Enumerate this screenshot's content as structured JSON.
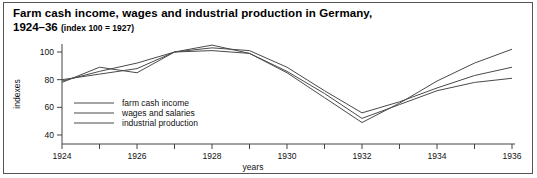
{
  "figure": {
    "title_line1": "Farm cash income, wages and industrial production in Germany,",
    "title_line2_years": "1924–36",
    "title_line2_sub": "(index 100 = 1927)"
  },
  "chart_data": {
    "type": "line",
    "title": "Farm cash income, wages and industrial production in Germany, 1924–36 (index 100 = 1927)",
    "subtitle": "(index 100 = 1927)",
    "xlabel": "years",
    "ylabel": "indexes",
    "xlim": [
      1924,
      1936
    ],
    "ylim": [
      40,
      108
    ],
    "grid": false,
    "legend_position": "inside-bottom-left",
    "yticks": [
      40,
      60,
      80,
      100
    ],
    "ytick_labels": [
      "40",
      "60",
      "80",
      "100"
    ],
    "xticks": [
      1924,
      1925,
      1926,
      1927,
      1928,
      1929,
      1930,
      1931,
      1932,
      1933,
      1934,
      1935,
      1936
    ],
    "xtick_labels": [
      "1924",
      "",
      "1926",
      "",
      "1928",
      "",
      "1930",
      "",
      "1932",
      "",
      "1934",
      "",
      "1936"
    ],
    "x": [
      1924,
      1925,
      1926,
      1927,
      1928,
      1929,
      1930,
      1931,
      1932,
      1933,
      1934,
      1935,
      1936
    ],
    "series": [
      {
        "name": "farm cash income",
        "color": "#4a4a4a",
        "values": [
          79,
          86,
          92,
          100,
          105,
          99,
          86,
          70,
          52,
          62,
          72,
          78,
          81
        ]
      },
      {
        "name": "wages and salaries",
        "color": "#4a4a4a",
        "values": [
          80,
          84,
          88,
          100,
          103,
          101,
          89,
          72,
          56,
          64,
          74,
          83,
          89
        ]
      },
      {
        "name": "industrial production",
        "color": "#4a4a4a",
        "values": [
          78,
          89,
          85,
          100,
          101,
          99,
          85,
          67,
          49,
          63,
          79,
          92,
          102
        ]
      }
    ]
  },
  "legend": {
    "items": [
      {
        "label": "farm cash income"
      },
      {
        "label": "wages and salaries"
      },
      {
        "label": "industrial production"
      }
    ]
  }
}
